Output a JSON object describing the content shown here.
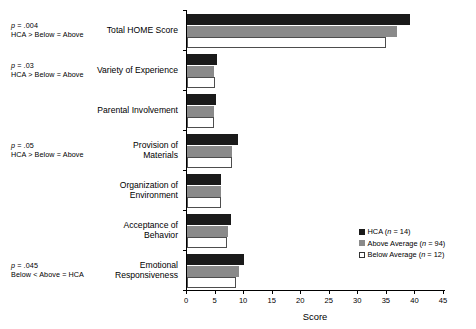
{
  "chart_data": {
    "type": "bar",
    "orientation": "horizontal",
    "title": "",
    "xlabel": "Score",
    "ylabel": "",
    "xlim": [
      0,
      45
    ],
    "xticks": [
      0,
      5,
      10,
      15,
      20,
      25,
      30,
      35,
      40,
      45
    ],
    "grid": false,
    "legend_position": "right-inside",
    "categories": [
      "Total HOME Score",
      "Variety of Experience",
      "Parental Involvement",
      "Provision of Materials",
      "Organization of Environment",
      "Acceptance of Behavior",
      "Emotional Responsiveness"
    ],
    "series": [
      {
        "name": "HCA",
        "n": 14,
        "legend_label": "HCA (n = 14)",
        "color": "#1a1a1a",
        "values": [
          39.0,
          5.2,
          5.0,
          9.0,
          6.0,
          7.7,
          10.0
        ]
      },
      {
        "name": "Above Average",
        "n": 94,
        "legend_label": "Above Average (n = 94)",
        "color": "#8a8a8a",
        "values": [
          36.8,
          4.7,
          4.8,
          7.8,
          5.9,
          7.2,
          9.1
        ]
      },
      {
        "name": "Below Average",
        "n": 12,
        "legend_label": "Below Average (n = 12)",
        "color": "#ffffff",
        "values": [
          34.8,
          4.9,
          4.7,
          7.8,
          5.9,
          7.0,
          8.6
        ]
      }
    ],
    "annotations": [
      {
        "category": "Total HOME Score",
        "p_label": "p",
        "p_value": " = .004",
        "comparison": "HCA > Below = Above"
      },
      {
        "category": "Variety of Experience",
        "p_label": "p",
        "p_value": " = .03",
        "comparison": "HCA > Below = Above"
      },
      {
        "category": "Provision of Materials",
        "p_label": "p",
        "p_value": " = .05",
        "comparison": "HCA > Below = Above"
      },
      {
        "category": "Emotional Responsiveness",
        "p_label": "p",
        "p_value": " = .045",
        "comparison": "Below < Above = HCA"
      }
    ]
  },
  "legend": {
    "rows": [
      {
        "prefix": "HCA (",
        "n_sym": "n",
        "suffix": " = 14)"
      },
      {
        "prefix": "Above Average (",
        "n_sym": "n",
        "suffix": " = 94)"
      },
      {
        "prefix": "Below Average (",
        "n_sym": "n",
        "suffix": " = 12)"
      }
    ]
  },
  "axis": {
    "x_title": "Score",
    "tick_labels": [
      "0",
      "5",
      "10",
      "15",
      "20",
      "25",
      "30",
      "35",
      "40",
      "45"
    ]
  }
}
